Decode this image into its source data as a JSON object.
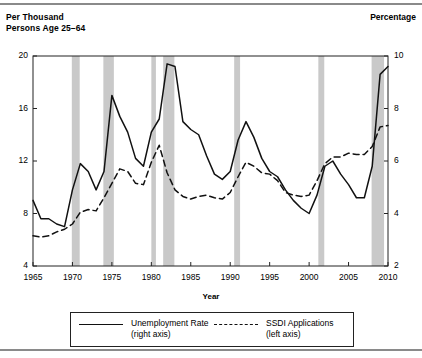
{
  "figure": {
    "left_axis_title": "Per Thousand\nPersons Age 25–64",
    "right_axis_title": "Percentage"
  },
  "legend": {
    "items": [
      {
        "label": "Unemployment Rate\n(right axis)",
        "style": "solid",
        "series": "unemployment_rate"
      },
      {
        "label": "SSDI Applications\n(left axis)",
        "style": "dashed",
        "series": "ssdi_applications"
      }
    ]
  },
  "chart_data": {
    "type": "line",
    "title": "",
    "xlabel": "Year",
    "ylabel": "Per Thousand Persons Age 25–64",
    "y2label": "Percentage",
    "xlim": [
      1965,
      2010
    ],
    "ylim": [
      4,
      20
    ],
    "y2lim": [
      2,
      10
    ],
    "xticks": [
      1965,
      1970,
      1975,
      1980,
      1985,
      1990,
      1995,
      2000,
      2005,
      2010
    ],
    "yticks": [
      4,
      8,
      12,
      16,
      20
    ],
    "y2ticks": [
      2,
      4,
      6,
      8,
      10
    ],
    "grid": false,
    "legend_position": "bottom",
    "x": [
      1965,
      1966,
      1967,
      1968,
      1969,
      1970,
      1971,
      1972,
      1973,
      1974,
      1975,
      1976,
      1977,
      1978,
      1979,
      1980,
      1981,
      1982,
      1983,
      1984,
      1985,
      1986,
      1987,
      1988,
      1989,
      1990,
      1991,
      1992,
      1993,
      1994,
      1995,
      1996,
      1997,
      1998,
      1999,
      2000,
      2001,
      2002,
      2003,
      2004,
      2005,
      2006,
      2007,
      2008,
      2009,
      2010
    ],
    "series": [
      {
        "name": "SSDI Applications",
        "axis": "left",
        "units": "per thousand persons age 25-64",
        "style": "dashed",
        "values": [
          6.3,
          6.2,
          6.3,
          6.6,
          6.8,
          7.2,
          8.1,
          8.3,
          8.2,
          9.2,
          10.3,
          11.4,
          11.2,
          10.3,
          10.2,
          11.9,
          13.2,
          11.1,
          9.8,
          9.3,
          9.1,
          9.3,
          9.4,
          9.2,
          9.1,
          9.6,
          10.8,
          11.9,
          11.6,
          11.1,
          11.0,
          10.5,
          9.6,
          9.4,
          9.3,
          9.4,
          10.5,
          11.8,
          12.3,
          12.3,
          12.6,
          12.5,
          12.5,
          13.1,
          14.6,
          14.7
        ]
      },
      {
        "name": "Unemployment Rate",
        "axis": "right",
        "units": "percent",
        "style": "solid",
        "values": [
          4.5,
          3.8,
          3.8,
          3.6,
          3.5,
          4.9,
          5.9,
          5.6,
          4.9,
          5.6,
          8.5,
          7.7,
          7.1,
          6.1,
          5.8,
          7.1,
          7.6,
          9.7,
          9.6,
          7.5,
          7.2,
          7.0,
          6.2,
          5.5,
          5.3,
          5.6,
          6.8,
          7.5,
          6.9,
          6.1,
          5.6,
          5.4,
          4.9,
          4.5,
          4.2,
          4.0,
          4.7,
          5.8,
          6.0,
          5.5,
          5.1,
          4.6,
          4.6,
          5.8,
          9.3,
          9.6
        ]
      }
    ],
    "recession_bands": [
      {
        "start": 1969.92,
        "end": 1970.92
      },
      {
        "start": 1973.92,
        "end": 1975.25
      },
      {
        "start": 1980.0,
        "end": 1980.58
      },
      {
        "start": 1981.5,
        "end": 1982.92
      },
      {
        "start": 1990.5,
        "end": 1991.25
      },
      {
        "start": 2001.17,
        "end": 2001.92
      },
      {
        "start": 2007.92,
        "end": 2009.5
      }
    ],
    "band_color": "#c9c9c9",
    "line_color": "#111111"
  }
}
